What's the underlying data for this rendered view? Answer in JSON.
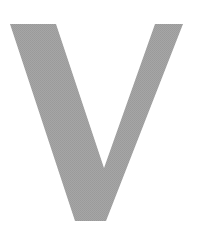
{
  "glyph": {
    "character": "V",
    "fill_color": "#a3a3a3",
    "background_color": "#ffffff"
  }
}
